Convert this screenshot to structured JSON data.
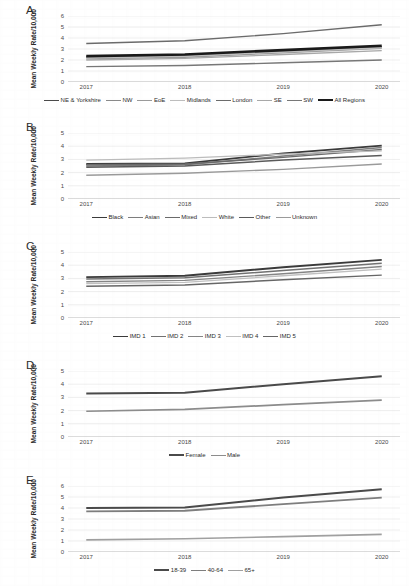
{
  "figure": {
    "ylabel": "Mean Weekly Rate/10,000",
    "xcategories": [
      "2017",
      "2018",
      "2019",
      "2020"
    ]
  },
  "panels": [
    {
      "letter": "A.",
      "ylabel": "Mean Weekly Rate/10,000",
      "yticks": [
        "0",
        "1",
        "2",
        "3",
        "4",
        "5",
        "6"
      ],
      "xticks": [
        "2017",
        "2018",
        "2019",
        "2020"
      ],
      "legend": [
        {
          "label": "NE & Yorkshire",
          "color": "#4a4a4a",
          "width": 1.5
        },
        {
          "label": "NW",
          "color": "#8a8a8a",
          "width": 1.3
        },
        {
          "label": "EoE",
          "color": "#9a9a9a",
          "width": 1.3
        },
        {
          "label": "Midlands",
          "color": "#bdbdbd",
          "width": 1.3
        },
        {
          "label": "London",
          "color": "#6b6b6b",
          "width": 1.4
        },
        {
          "label": "SE",
          "color": "#a8a8a8",
          "width": 1.3
        },
        {
          "label": "SW",
          "color": "#777777",
          "width": 1.3
        },
        {
          "label": "All Regions",
          "color": "#1a1a1a",
          "width": 2.6
        }
      ]
    },
    {
      "letter": "B.",
      "ylabel": "Mean Weekly Rate/10,000",
      "yticks": [
        "0",
        "1",
        "2",
        "3",
        "4",
        "5"
      ],
      "xticks": [
        "2017",
        "2018",
        "2019",
        "2020"
      ],
      "legend": [
        {
          "label": "Black",
          "color": "#3a3a3a",
          "width": 1.8
        },
        {
          "label": "Asian",
          "color": "#7d7d7d",
          "width": 1.5
        },
        {
          "label": "Mixed",
          "color": "#6a6a6a",
          "width": 1.4
        },
        {
          "label": "White",
          "color": "#bcbcbc",
          "width": 1.3
        },
        {
          "label": "Other",
          "color": "#5a5a5a",
          "width": 1.4
        },
        {
          "label": "Unknown",
          "color": "#9a9a9a",
          "width": 1.3
        }
      ]
    },
    {
      "letter": "C.",
      "ylabel": "Mean Weekly Rate/10,000",
      "yticks": [
        "0",
        "1",
        "2",
        "3",
        "4",
        "5"
      ],
      "xticks": [
        "2017",
        "2018",
        "2019",
        "2020"
      ],
      "legend": [
        {
          "label": "IMD 1",
          "color": "#3a3a3a",
          "width": 1.9
        },
        {
          "label": "IMD 2",
          "color": "#717171",
          "width": 1.5
        },
        {
          "label": "IMD 3",
          "color": "#858585",
          "width": 1.4
        },
        {
          "label": "IMD 4",
          "color": "#c0c0c0",
          "width": 1.3
        },
        {
          "label": "IMD 5",
          "color": "#666666",
          "width": 1.4
        }
      ]
    },
    {
      "letter": "D.",
      "ylabel": "Mean Weekly Rate/10,000",
      "yticks": [
        "0",
        "1",
        "2",
        "3",
        "4",
        "5"
      ],
      "xticks": [
        "2017",
        "2018",
        "2019",
        "2020"
      ],
      "legend": [
        {
          "label": "Female",
          "color": "#4a4a4a",
          "width": 2.0
        },
        {
          "label": "Male",
          "color": "#8c8c8c",
          "width": 1.7
        }
      ]
    },
    {
      "letter": "E.",
      "ylabel": "Mean Weekly Rate/10,000",
      "yticks": [
        "0",
        "1",
        "2",
        "3",
        "4",
        "5",
        "6"
      ],
      "xticks": [
        "2017",
        "2018",
        "2019",
        "2020"
      ],
      "legend": [
        {
          "label": "18-39",
          "color": "#4a4a4a",
          "width": 2.0
        },
        {
          "label": "40-64",
          "color": "#7e7e7e",
          "width": 1.8
        },
        {
          "label": "65+",
          "color": "#a0a0a0",
          "width": 1.6
        }
      ]
    }
  ],
  "chart_data": [
    {
      "panel": "A",
      "type": "line",
      "title": "",
      "xlabel": "",
      "ylabel": "Mean Weekly Rate/10,000",
      "x": [
        "2017",
        "2018",
        "2019",
        "2020"
      ],
      "ylim": [
        0,
        6
      ],
      "yticks": [
        0,
        1,
        2,
        3,
        4,
        5,
        6
      ],
      "grid": true,
      "legend_position": "bottom",
      "series": [
        {
          "name": "NE & Yorkshire",
          "values": [
            2.3,
            2.45,
            2.85,
            3.2
          ],
          "color": "#4a4a4a"
        },
        {
          "name": "NW",
          "values": [
            2.25,
            2.4,
            2.8,
            3.15
          ],
          "color": "#8a8a8a"
        },
        {
          "name": "EoE",
          "values": [
            2.1,
            2.25,
            2.65,
            3.05
          ],
          "color": "#9a9a9a"
        },
        {
          "name": "Midlands",
          "values": [
            2.2,
            2.35,
            2.75,
            3.1
          ],
          "color": "#bdbdbd"
        },
        {
          "name": "London",
          "values": [
            3.5,
            3.75,
            4.4,
            5.2
          ],
          "color": "#6b6b6b"
        },
        {
          "name": "SE",
          "values": [
            2.0,
            2.15,
            2.5,
            2.85
          ],
          "color": "#a8a8a8"
        },
        {
          "name": "SW",
          "values": [
            1.4,
            1.5,
            1.75,
            2.0
          ],
          "color": "#777777"
        },
        {
          "name": "All Regions",
          "values": [
            2.35,
            2.5,
            2.9,
            3.3
          ],
          "color": "#1a1a1a"
        }
      ]
    },
    {
      "panel": "B",
      "type": "line",
      "title": "",
      "xlabel": "",
      "ylabel": "Mean Weekly Rate/10,000",
      "x": [
        "2017",
        "2018",
        "2019",
        "2020"
      ],
      "ylim": [
        0,
        5
      ],
      "yticks": [
        0,
        1,
        2,
        3,
        4,
        5
      ],
      "grid": true,
      "legend_position": "bottom",
      "series": [
        {
          "name": "Black",
          "values": [
            2.65,
            2.7,
            3.45,
            4.05
          ],
          "color": "#3a3a3a"
        },
        {
          "name": "Asian",
          "values": [
            2.5,
            2.6,
            3.25,
            3.9
          ],
          "color": "#7d7d7d"
        },
        {
          "name": "Mixed",
          "values": [
            2.6,
            2.65,
            3.15,
            3.75
          ],
          "color": "#6a6a6a"
        },
        {
          "name": "White",
          "values": [
            2.95,
            3.1,
            3.4,
            3.65
          ],
          "color": "#bcbcbc"
        },
        {
          "name": "Other",
          "values": [
            2.4,
            2.5,
            2.95,
            3.3
          ],
          "color": "#5a5a5a"
        },
        {
          "name": "Unknown",
          "values": [
            1.8,
            1.95,
            2.25,
            2.65
          ],
          "color": "#9a9a9a"
        }
      ]
    },
    {
      "panel": "C",
      "type": "line",
      "title": "",
      "xlabel": "",
      "ylabel": "Mean Weekly Rate/10,000",
      "x": [
        "2017",
        "2018",
        "2019",
        "2020"
      ],
      "ylim": [
        0,
        5
      ],
      "yticks": [
        0,
        1,
        2,
        3,
        4,
        5
      ],
      "grid": true,
      "legend_position": "bottom",
      "series": [
        {
          "name": "IMD 1",
          "values": [
            3.1,
            3.2,
            3.85,
            4.4
          ],
          "color": "#3a3a3a"
        },
        {
          "name": "IMD 2",
          "values": [
            2.95,
            3.05,
            3.6,
            4.15
          ],
          "color": "#717171"
        },
        {
          "name": "IMD 3",
          "values": [
            2.75,
            2.85,
            3.35,
            3.9
          ],
          "color": "#858585"
        },
        {
          "name": "IMD 4",
          "values": [
            2.6,
            2.7,
            3.2,
            3.7
          ],
          "color": "#c0c0c0"
        },
        {
          "name": "IMD 5",
          "values": [
            2.4,
            2.5,
            2.9,
            3.25
          ],
          "color": "#666666"
        }
      ]
    },
    {
      "panel": "D",
      "type": "line",
      "title": "",
      "xlabel": "",
      "ylabel": "Mean Weekly Rate/10,000",
      "x": [
        "2017",
        "2018",
        "2019",
        "2020"
      ],
      "ylim": [
        0,
        5
      ],
      "yticks": [
        0,
        1,
        2,
        3,
        4,
        5
      ],
      "grid": true,
      "legend_position": "bottom",
      "series": [
        {
          "name": "Female",
          "values": [
            3.3,
            3.35,
            4.0,
            4.6
          ],
          "color": "#4a4a4a"
        },
        {
          "name": "Male",
          "values": [
            1.95,
            2.1,
            2.45,
            2.8
          ],
          "color": "#8c8c8c"
        }
      ]
    },
    {
      "panel": "E",
      "type": "line",
      "title": "",
      "xlabel": "",
      "ylabel": "Mean Weekly Rate/10,000",
      "x": [
        "2017",
        "2018",
        "2019",
        "2020"
      ],
      "ylim": [
        0,
        6
      ],
      "yticks": [
        0,
        1,
        2,
        3,
        4,
        5,
        6
      ],
      "grid": true,
      "legend_position": "bottom",
      "series": [
        {
          "name": "18-39",
          "values": [
            4.0,
            4.05,
            4.95,
            5.7
          ],
          "color": "#4a4a4a"
        },
        {
          "name": "40-64",
          "values": [
            3.7,
            3.75,
            4.35,
            4.95
          ],
          "color": "#7e7e7e"
        },
        {
          "name": "65+",
          "values": [
            1.1,
            1.2,
            1.4,
            1.6
          ],
          "color": "#a0a0a0"
        }
      ]
    }
  ]
}
